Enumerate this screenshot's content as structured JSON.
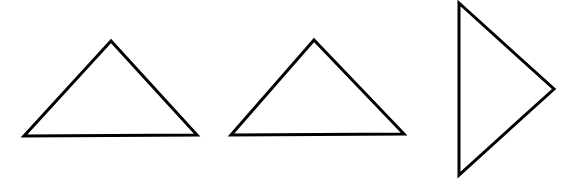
{
  "canvas": {
    "width": 578,
    "height": 188,
    "background": "#ffffff"
  },
  "stroke": {
    "color": "#000000",
    "width": 3
  },
  "shapes": [
    {
      "name": "triangle-left",
      "orientation": "apex-up",
      "points": [
        [
          111,
          41
        ],
        [
          24,
          136
        ],
        [
          197,
          135
        ]
      ]
    },
    {
      "name": "triangle-middle",
      "orientation": "apex-up",
      "points": [
        [
          314,
          40
        ],
        [
          231,
          135
        ],
        [
          404,
          134
        ]
      ]
    },
    {
      "name": "triangle-right",
      "orientation": "apex-right",
      "points": [
        [
          459,
          3
        ],
        [
          554,
          89
        ],
        [
          459,
          175
        ]
      ]
    }
  ]
}
